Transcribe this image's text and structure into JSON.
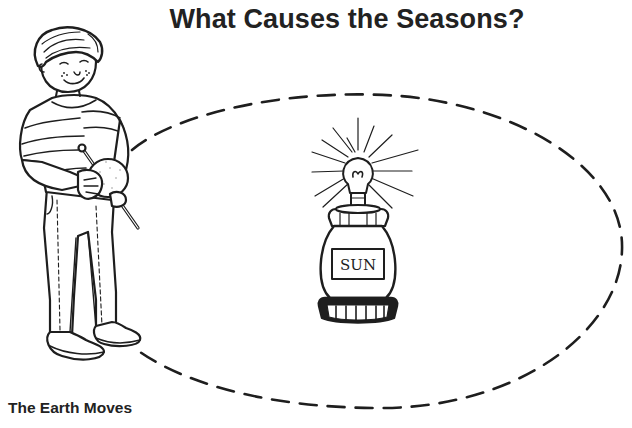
{
  "worksheet": {
    "title": "What Causes the Seasons?",
    "caption": "The Earth Moves"
  },
  "illustration": {
    "sun_model": {
      "label": "SUN",
      "icon": "light-bulb-icon",
      "description": "lamp with bulb on a jar labeled SUN"
    },
    "boy": {
      "description": "boy holding a ball on a stick (model Earth)",
      "icon": "earth-ball-icon"
    },
    "orbit": {
      "style": "dashed",
      "shape": "ellipse"
    }
  },
  "colors": {
    "ink": "#1e1e1e",
    "background": "#ffffff"
  }
}
